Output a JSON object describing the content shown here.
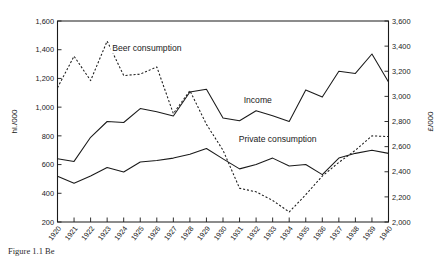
{
  "figure": {
    "caption": "Figure 1.1 Be"
  },
  "chart_data": {
    "type": "line",
    "title": "",
    "xlabel": "",
    "ylabel": "hl./000",
    "y2label": "£/000",
    "grid": false,
    "legend_position": "inline-annotations",
    "categories": [
      "1920",
      "1921",
      "1922",
      "1923",
      "1924",
      "1925",
      "1926",
      "1927",
      "1928",
      "1929",
      "1930",
      "1931",
      "1932",
      "1933",
      "1934",
      "1935",
      "1936",
      "1937",
      "1938",
      "1939",
      "1940"
    ],
    "x": [
      1920,
      1921,
      1922,
      1923,
      1924,
      1925,
      1926,
      1927,
      1928,
      1929,
      1930,
      1931,
      1932,
      1933,
      1934,
      1935,
      1936,
      1937,
      1938,
      1939,
      1940
    ],
    "ylim": [
      200,
      1600
    ],
    "yticks": [
      "200",
      "400",
      "600",
      "800",
      "1,000",
      "1,200",
      "1,400",
      "1,600"
    ],
    "ytick_values": [
      200,
      400,
      600,
      800,
      1000,
      1200,
      1400,
      1600
    ],
    "y2lim": [
      2000,
      3600
    ],
    "y2ticks": [
      "2,000",
      "2,200",
      "2,400",
      "2,600",
      "2,800",
      "3,000",
      "3,200",
      "3,400",
      "3,600"
    ],
    "y2tick_values": [
      2000,
      2200,
      2400,
      2600,
      2800,
      3000,
      3200,
      3400,
      3600
    ],
    "xtick_labels": [
      "1920",
      "1921",
      "1922",
      "1923",
      "1924",
      "1925",
      "1926",
      "1927",
      "1928",
      "1929",
      "1930",
      "1931",
      "1932",
      "1933",
      "1934",
      "1935",
      "1936",
      "1937",
      "1938",
      "1939",
      "1940"
    ],
    "series": [
      {
        "name": "Beer consumption",
        "axis": "left",
        "style": "dashed",
        "units": "hl./000",
        "label_x": 1925.4,
        "label_y": 1390,
        "values": [
          1135,
          1355,
          1185,
          1460,
          1220,
          1230,
          1280,
          955,
          1115,
          880,
          700,
          435,
          410,
          350,
          270,
          390,
          520,
          615,
          700,
          800,
          795
        ]
      },
      {
        "name": "Income",
        "axis": "right",
        "style": "solid",
        "units": "£/000",
        "label_x": 1932.1,
        "label_y": 1030,
        "values_left_scale": [
          640,
          622,
          790,
          900,
          893,
          990,
          968,
          938,
          1105,
          1125,
          925,
          905,
          975,
          940,
          900,
          1120,
          1070,
          1250,
          1235,
          1370,
          1175
        ],
        "values": [
          2731,
          2711,
          2903,
          3029,
          3020,
          3131,
          3106,
          3072,
          3263,
          3286,
          3057,
          3034,
          3114,
          3074,
          3029,
          3280,
          3223,
          3429,
          3411,
          3566,
          3343
        ]
      },
      {
        "name": "Private consumption",
        "axis": "right",
        "style": "solid",
        "units": "£/000",
        "label_x": 1933.3,
        "label_y": 755,
        "values_left_scale": [
          518,
          470,
          520,
          580,
          548,
          618,
          628,
          645,
          672,
          712,
          640,
          570,
          600,
          645,
          590,
          600,
          530,
          645,
          678,
          700,
          678
        ],
        "values": [
          2592,
          2537,
          2594,
          2663,
          2626,
          2706,
          2718,
          2737,
          2768,
          2814,
          2731,
          2651,
          2686,
          2737,
          2674,
          2686,
          2606,
          2737,
          2775,
          2800,
          2775
        ]
      }
    ]
  }
}
